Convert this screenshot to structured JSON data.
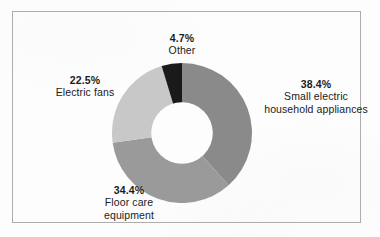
{
  "frame": {
    "border_color": "#adadad",
    "background_color": "#fdfdfd"
  },
  "chart_data": {
    "type": "pie",
    "variant": "donut",
    "title": "",
    "subtitle": "",
    "xlabel": "",
    "ylabel": "",
    "legend_position": "none",
    "labels_position": "outside",
    "start_angle_deg": 0,
    "direction": "clockwise",
    "hole_ratio": 0.44,
    "units": "percent",
    "total": 100.0,
    "categories": [
      "Small electric household appliances",
      "Floor care equipment",
      "Electric fans",
      "Other"
    ],
    "values": [
      38.4,
      34.4,
      22.5,
      4.7
    ],
    "slices": [
      {
        "id": "appliances",
        "label": "Small electric\nhousehold appliances",
        "label_line1": "Small electric",
        "label_line2": "household appliances",
        "percent_text": "38.4%",
        "value": 38.4,
        "color": "#8a8a8a",
        "start_deg": 0.0,
        "end_deg": 138.24
      },
      {
        "id": "floor-care",
        "label": "Floor care\nequipment",
        "label_line1": "Floor care",
        "label_line2": "equipment",
        "percent_text": "34.4%",
        "value": 34.4,
        "color": "#9a9a9a",
        "start_deg": 138.24,
        "end_deg": 262.08
      },
      {
        "id": "electric-fans",
        "label": "Electric fans",
        "label_line1": "Electric fans",
        "label_line2": "",
        "percent_text": "22.5%",
        "value": 22.5,
        "color": "#c8c8c8",
        "start_deg": 262.08,
        "end_deg": 343.08
      },
      {
        "id": "other",
        "label": "Other",
        "label_line1": "Other",
        "label_line2": "",
        "percent_text": "4.7%",
        "value": 4.7,
        "color": "#1a1a1a",
        "start_deg": 343.08,
        "end_deg": 360.0
      }
    ]
  }
}
